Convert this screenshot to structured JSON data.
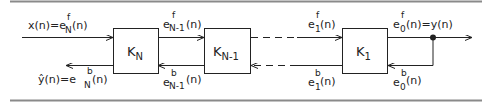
{
  "diagram": {
    "type": "lattice-filter-block-diagram",
    "rules": {
      "color": "#8a8a8a"
    },
    "stroke_color": "#222222",
    "blocks": [
      {
        "id": "KN",
        "base": "K",
        "sub": "N"
      },
      {
        "id": "KN-1",
        "base": "K",
        "sub": "N-1"
      },
      {
        "id": "K1",
        "base": "K",
        "sub": "1"
      }
    ],
    "labels": {
      "input": {
        "lhs": "x(n)",
        "eq": "=",
        "base": "e",
        "sup": "f",
        "sub": "N",
        "arg": "(n)"
      },
      "output_hat": {
        "lhs": "ŷ(n)",
        "eq": "=",
        "base": "e",
        "sup": "b",
        "sub": "N",
        "arg": "(n)"
      },
      "f_N1": {
        "base": "e",
        "sup": "f",
        "sub": "N-1",
        "arg": "(n)"
      },
      "b_N1": {
        "base": "e",
        "sup": "b",
        "sub": "N-1",
        "arg": "(n)"
      },
      "f_1": {
        "base": "e",
        "sup": "f",
        "sub": "1",
        "arg": "(n)"
      },
      "b_1": {
        "base": "e",
        "sup": "b",
        "sub": "1",
        "arg": "(n)"
      },
      "f_0": {
        "base": "e",
        "sup": "f",
        "sub": "0",
        "arg": "(n)",
        "eq": "=",
        "rhs": "y(n)"
      },
      "b_0": {
        "base": "e",
        "sup": "b",
        "sub": "0",
        "arg": "(n)"
      }
    }
  }
}
